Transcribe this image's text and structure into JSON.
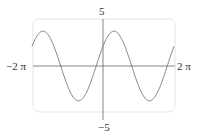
{
  "chart_data": {
    "type": "line",
    "title": "",
    "xlabel": "",
    "ylabel": "",
    "xlim": [
      -6.283,
      6.283
    ],
    "ylim": [
      -5,
      5
    ],
    "x_tick_labels": [
      "-2π",
      "2π"
    ],
    "y_tick_labels": [
      "5",
      "-5"
    ],
    "grid": false,
    "series": [
      {
        "name": "f(x) ≈ 3.7 sin(x + 0.6)",
        "amplitude": 3.7,
        "phase": 0.6,
        "x": [
          -6.283,
          -5.3,
          -3.66,
          -2.17,
          -0.6,
          0,
          0.97,
          2.54,
          4.1,
          5.68,
          6.283
        ],
        "y": [
          2.1,
          3.7,
          0,
          -3.7,
          0,
          2.1,
          3.7,
          0,
          -3.7,
          0,
          2.1
        ]
      }
    ]
  },
  "labels": {
    "x_min": "−2 π",
    "x_max": "2 π",
    "y_max": "5",
    "y_min": "−5"
  }
}
